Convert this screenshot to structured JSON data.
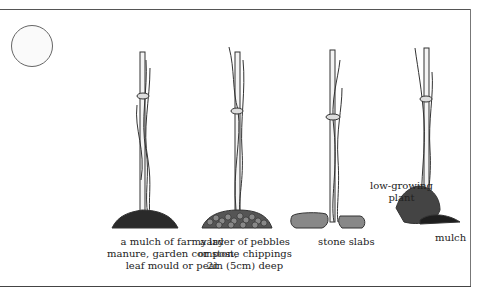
{
  "figure": {
    "panels": [
      {
        "id": "manure",
        "caption": "a mulch of farmyard\nmanure, garden compost,\nleaf mould or peat"
      },
      {
        "id": "pebbles",
        "caption": "a layer of pebbles\nor stone chippings\n2in (5cm) deep"
      },
      {
        "id": "slabs",
        "caption": "stone slabs"
      },
      {
        "id": "plant",
        "caption": "mulch",
        "extra_label": "low-growing\nplant"
      }
    ],
    "colors": {
      "ink": "#222222",
      "line": "#555555",
      "background": "#ffffff"
    }
  }
}
